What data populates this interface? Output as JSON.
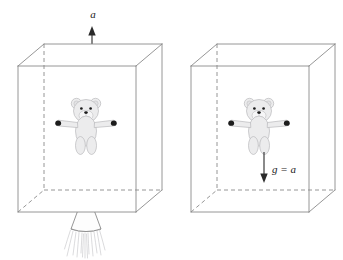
{
  "figure": {
    "type": "physics-diagram",
    "caption": "Equivalence principle: accelerating rocket box versus box at rest in gravity",
    "background_color": "#ffffff",
    "line_color": "#8a8a8a",
    "label_color": "#1a1a1a"
  },
  "panels": [
    {
      "id": "left",
      "name": "accelerating-box",
      "box": {
        "front": {
          "x": 18,
          "y": 66,
          "w": 118,
          "h": 146
        },
        "depth_x": 26,
        "depth_y": -22,
        "hidden_edges": "back-left-vertical, back-bottom-horizontal, back-bottom-left-diagonal"
      },
      "arrow": {
        "name": "acceleration-arrow",
        "direction": "up",
        "label": "a",
        "label_x": 93,
        "label_y": 17,
        "x": 92,
        "y_tail": 62,
        "y_head": 28
      },
      "thruster": {
        "present": true,
        "name": "rocket-nozzle",
        "exhaust_streaks": 13
      },
      "bear": {
        "present": true,
        "cx": 86,
        "cy": 124,
        "scale": 1.0,
        "state": "floating"
      }
    },
    {
      "id": "right",
      "name": "box-in-gravity",
      "box": {
        "front": {
          "x": 191,
          "y": 66,
          "w": 118,
          "h": 146
        },
        "depth_x": 26,
        "depth_y": -22,
        "hidden_edges": "back-left-vertical, back-bottom-horizontal, back-bottom-left-diagonal"
      },
      "arrow": {
        "name": "gravity-arrow",
        "direction": "down",
        "label": "g = a",
        "label_x": 278,
        "label_y": 172,
        "x": 264,
        "y_tail": 152,
        "y_head": 182
      },
      "thruster": {
        "present": false
      },
      "bear": {
        "present": true,
        "cx": 259,
        "cy": 124,
        "scale": 1.0,
        "state": "floating"
      }
    }
  ],
  "labels": {
    "acceleration": "a",
    "gravity_equals_acceleration": "g = a"
  },
  "colors": {
    "bear_fill": "#ececed",
    "bear_outline": "#b9b9bb",
    "paw_dark": "#1c1c1c",
    "edge": "#8a8a8a",
    "arrow": "#2a2a2a",
    "flame": "#d2d2d4"
  }
}
